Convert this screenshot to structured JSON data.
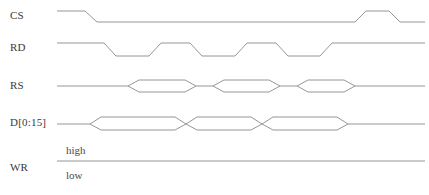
{
  "diagram": {
    "width": 429,
    "height": 195,
    "background_color": "#ffffff",
    "stroke_color": "#8a8a8a",
    "text_color": "#3a3a3a",
    "wave_start_x": 57,
    "wave_end_x": 425
  },
  "signals": [
    {
      "name": "CS",
      "label": "CS",
      "type": "logic",
      "row_y": 16,
      "high_y": 11,
      "low_y": 22,
      "label_x": 10,
      "label_y": 13,
      "segments": [
        {
          "level": "high",
          "from_x": 57,
          "to_x": 85
        },
        {
          "level": "transition",
          "from_x": 85,
          "to_x": 97,
          "to_level": "low"
        },
        {
          "level": "low",
          "from_x": 97,
          "to_x": 355
        },
        {
          "level": "transition",
          "from_x": 355,
          "to_x": 366,
          "to_level": "high"
        },
        {
          "level": "high",
          "from_x": 366,
          "to_x": 389
        },
        {
          "level": "transition",
          "from_x": 389,
          "to_x": 400,
          "to_level": "low"
        },
        {
          "level": "low",
          "from_x": 400,
          "to_x": 425
        }
      ]
    },
    {
      "name": "RD",
      "label": "RD",
      "type": "logic",
      "row_y": 48,
      "high_y": 43,
      "low_y": 56,
      "label_x": 10,
      "label_y": 45,
      "segments": [
        {
          "level": "high",
          "from_x": 57,
          "to_x": 104
        },
        {
          "level": "transition",
          "from_x": 104,
          "to_x": 116,
          "to_level": "low"
        },
        {
          "level": "low",
          "from_x": 116,
          "to_x": 149
        },
        {
          "level": "transition",
          "from_x": 149,
          "to_x": 161,
          "to_level": "high"
        },
        {
          "level": "high",
          "from_x": 161,
          "to_x": 190
        },
        {
          "level": "transition",
          "from_x": 190,
          "to_x": 202,
          "to_level": "low"
        },
        {
          "level": "low",
          "from_x": 202,
          "to_x": 235
        },
        {
          "level": "transition",
          "from_x": 235,
          "to_x": 247,
          "to_level": "high"
        },
        {
          "level": "high",
          "from_x": 247,
          "to_x": 276
        },
        {
          "level": "transition",
          "from_x": 276,
          "to_x": 288,
          "to_level": "low"
        },
        {
          "level": "low",
          "from_x": 288,
          "to_x": 320
        },
        {
          "level": "transition",
          "from_x": 320,
          "to_x": 332,
          "to_level": "high"
        },
        {
          "level": "high",
          "from_x": 332,
          "to_x": 425
        }
      ]
    },
    {
      "name": "RS",
      "label": "RS",
      "type": "bus",
      "row_y": 86,
      "top_y": 80,
      "bottom_y": 92,
      "mid_y": 86,
      "label_x": 10,
      "label_y": 83,
      "buses": [
        {
          "from_x": 128,
          "to_x": 196,
          "skew": 11
        },
        {
          "from_x": 213,
          "to_x": 280,
          "skew": 11
        },
        {
          "from_x": 297,
          "to_x": 355,
          "skew": 11
        }
      ]
    },
    {
      "name": "D[0:15]",
      "label": "D[0:15]",
      "type": "bus",
      "row_y": 124,
      "top_y": 117,
      "bottom_y": 130,
      "mid_y": 124,
      "label_x": 10,
      "label_y": 120,
      "buses": [
        {
          "from_x": 90,
          "to_x": 186,
          "skew": 11
        },
        {
          "from_x": 186,
          "to_x": 262,
          "skew": 11
        },
        {
          "from_x": 262,
          "to_x": 348,
          "skew": 11
        }
      ]
    },
    {
      "name": "WR",
      "label": "WR",
      "type": "static-high",
      "row_y": 161,
      "level_y": 161,
      "label_x": 10,
      "label_y": 165,
      "segments": [
        {
          "level": "high",
          "from_x": 57,
          "to_x": 425
        }
      ]
    }
  ],
  "level_annotations": [
    {
      "id": "high-label",
      "text": "high",
      "x": 66,
      "y": 150
    },
    {
      "id": "low-label",
      "text": "low",
      "x": 66,
      "y": 175
    }
  ]
}
